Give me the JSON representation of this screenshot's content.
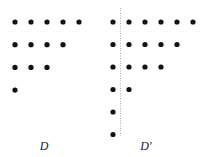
{
  "diagrams": [
    {
      "label": "D",
      "label_pos": [
        44,
        150
      ],
      "rows": [
        5,
        4,
        3,
        1
      ],
      "origin": [
        15,
        22
      ],
      "spacing": [
        16,
        22.7
      ]
    },
    {
      "label": "D′",
      "label_pos": [
        146,
        150
      ],
      "rows": [
        6,
        5,
        4,
        2,
        1,
        1
      ],
      "origin": [
        113,
        22
      ],
      "spacing": [
        16,
        22.5
      ],
      "axis_line": {
        "x": 120.5,
        "y1": 8,
        "y2": 136,
        "style": "dotted"
      }
    }
  ],
  "colors": {
    "dot": "#111111",
    "axis": "#999999",
    "label": "#222222"
  },
  "dot_radius": 2.6
}
